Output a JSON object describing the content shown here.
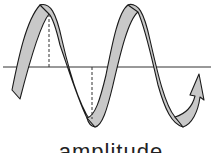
{
  "diagram": {
    "caption": "amplitude",
    "colors": {
      "ribbon_fill": "#c8c8c8",
      "ribbon_stroke": "#1a1a1a",
      "axis": "#333333",
      "dashed": "#333333",
      "background": "#ffffff"
    },
    "elements": [
      {
        "name": "horizontal-axis",
        "type": "line"
      },
      {
        "name": "wave-ribbon",
        "type": "ribbon",
        "cycles": 2,
        "ends_with": "arrowhead"
      },
      {
        "name": "amplitude-marker-crest",
        "type": "dashed-line"
      },
      {
        "name": "amplitude-marker-trough",
        "type": "dashed-line"
      }
    ]
  }
}
